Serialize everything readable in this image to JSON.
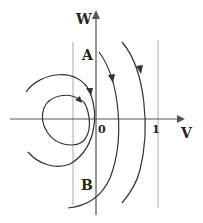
{
  "diagram": {
    "type": "phase-plane",
    "axes": {
      "x_label": "V",
      "y_label": "W",
      "origin_label": "0",
      "tick_label": "1"
    },
    "points": [
      {
        "label": "A"
      },
      {
        "label": "B"
      }
    ],
    "colors": {
      "curve": "#333333",
      "axis": "#555555",
      "guide": "#aaaaaa"
    }
  }
}
